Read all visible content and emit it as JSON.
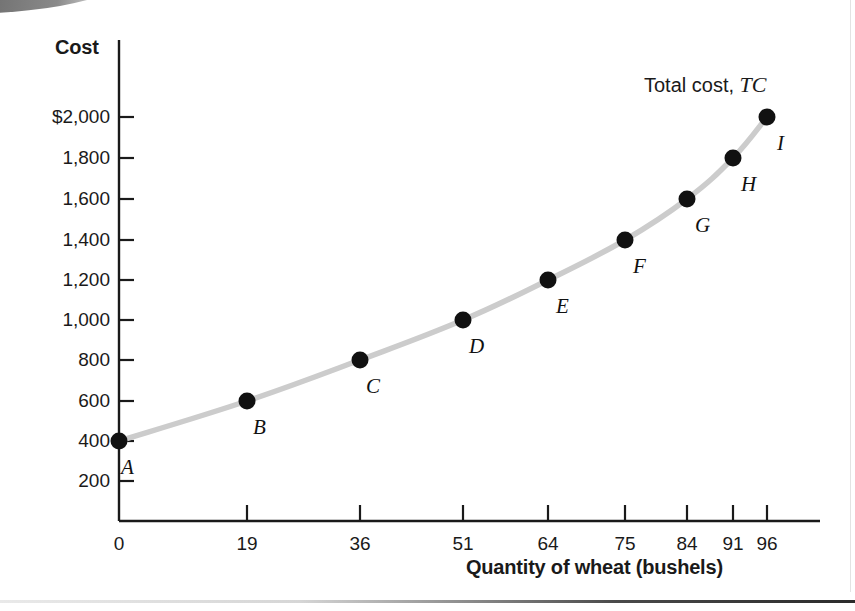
{
  "figure": {
    "name": "total-cost-curve-figure",
    "curve_label_prefix": "Total cost, ",
    "curve_label_symbol": "TC"
  },
  "chart_data": {
    "type": "line",
    "title": "",
    "subtitle": "",
    "xlabel": "Quantity of wheat (bushels)",
    "ylabel": "Cost",
    "xlim": [
      0,
      100
    ],
    "ylim": [
      0,
      2100
    ],
    "grid": false,
    "legend_position": "inline-annotation",
    "legend_entries": [
      "Total cost, TC"
    ],
    "series": [
      {
        "name": "Total cost, TC",
        "color": "#cccccc",
        "marker_color": "#111111",
        "x": [
          0,
          19,
          36,
          51,
          64,
          75,
          84,
          91,
          96
        ],
        "y": [
          400,
          600,
          800,
          1000,
          1200,
          1400,
          1600,
          1800,
          2000
        ],
        "point_labels": [
          "A",
          "B",
          "C",
          "D",
          "E",
          "F",
          "G",
          "H",
          "I"
        ]
      }
    ],
    "xticks": [
      0,
      19,
      36,
      51,
      64,
      75,
      84,
      91,
      96
    ],
    "xtick_labels": [
      "0",
      "19",
      "36",
      "51",
      "64",
      "75",
      "84",
      "91",
      "96"
    ],
    "yticks": [
      200,
      400,
      600,
      800,
      1000,
      1200,
      1400,
      1600,
      1800,
      2000
    ],
    "ytick_labels": [
      "200",
      "400",
      "600",
      "800",
      "1,000",
      "1,200",
      "1,400",
      "1,600",
      "1,800",
      "$2,000"
    ],
    "annotations": [
      {
        "text": "Total cost, TC",
        "x": 84,
        "y": 2150
      }
    ]
  },
  "colors": {
    "curve": "#cccccc",
    "marker": "#111111",
    "axis": "#1a1a1a",
    "text": "#1a1a1a",
    "background": "#ffffff"
  }
}
